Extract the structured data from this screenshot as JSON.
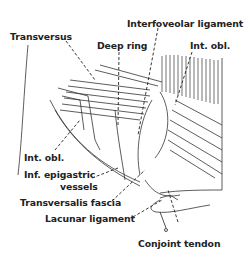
{
  "figure": {
    "type": "anatomical illustration",
    "labels": {
      "transversus": "Transversus",
      "interfoveolar": "Interfoveolar ligament",
      "deep_ring": "Deep ring",
      "int_obl_top": "Int. obl.",
      "int_obl_left": "Int. obl.",
      "inf_epigastric_1": "Inf. epigastric",
      "inf_epigastric_2": "vessels",
      "transversalis": "Transversalis fascia",
      "lacunar": "Lacunar ligament",
      "conjoint": "Conjoint tendon"
    },
    "colors": {
      "ink": "#222222",
      "background": "#ffffff"
    }
  }
}
